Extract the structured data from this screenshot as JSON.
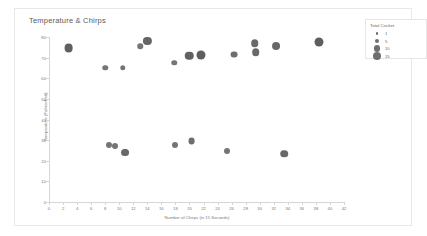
{
  "chart_data": {
    "type": "scatter",
    "title": "Temperature & Chirps",
    "xlabel": "Number of Chirps (in 15 Seconds)",
    "ylabel": "Temperature (Fahrenheit)",
    "xlim": [
      0,
      42
    ],
    "ylim": [
      0,
      80
    ],
    "xticks": [
      0,
      2,
      4,
      6,
      8,
      10,
      12,
      14,
      16,
      18,
      20,
      22,
      24,
      26,
      28,
      30,
      32,
      34,
      36,
      38,
      40,
      42
    ],
    "yticks": [
      0,
      10,
      20,
      30,
      40,
      50,
      60,
      70,
      80
    ],
    "grid": false,
    "legend_position": "top-right",
    "size_encoding": "Total Cricket",
    "point_color": "#4a4a4a",
    "points": [
      {
        "x": 2.8,
        "y": 74.5,
        "size": 12
      },
      {
        "x": 8.0,
        "y": 65.0,
        "size": 3
      },
      {
        "x": 8.6,
        "y": 27.5,
        "size": 4
      },
      {
        "x": 9.4,
        "y": 27.0,
        "size": 4
      },
      {
        "x": 10.5,
        "y": 65.0,
        "size": 3
      },
      {
        "x": 10.8,
        "y": 24.0,
        "size": 9
      },
      {
        "x": 13.0,
        "y": 75.5,
        "size": 3
      },
      {
        "x": 14.0,
        "y": 78.0,
        "size": 10
      },
      {
        "x": 17.8,
        "y": 67.5,
        "size": 3
      },
      {
        "x": 17.9,
        "y": 27.5,
        "size": 4
      },
      {
        "x": 20.0,
        "y": 71.0,
        "size": 11
      },
      {
        "x": 20.3,
        "y": 29.5,
        "size": 6
      },
      {
        "x": 21.7,
        "y": 71.5,
        "size": 13
      },
      {
        "x": 25.4,
        "y": 24.5,
        "size": 4
      },
      {
        "x": 26.4,
        "y": 71.5,
        "size": 6
      },
      {
        "x": 29.3,
        "y": 77.0,
        "size": 8
      },
      {
        "x": 29.4,
        "y": 72.5,
        "size": 8
      },
      {
        "x": 32.3,
        "y": 75.5,
        "size": 9
      },
      {
        "x": 33.5,
        "y": 23.5,
        "size": 8
      },
      {
        "x": 38.4,
        "y": 77.5,
        "size": 13
      }
    ]
  },
  "legend": {
    "title": "Total Cricket",
    "items": [
      {
        "label": "1",
        "radius": 1.2
      },
      {
        "label": "5",
        "radius": 2.3
      },
      {
        "label": "10",
        "radius": 3.2
      },
      {
        "label": "15",
        "radius": 4.0
      }
    ]
  }
}
